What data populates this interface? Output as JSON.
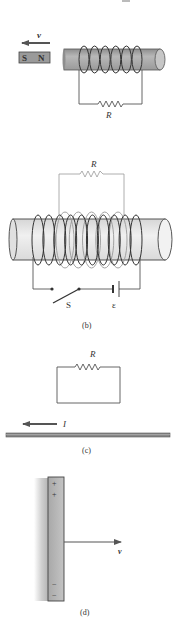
{
  "figure": {
    "panel_a": {
      "top_caption_fragment": "",
      "velocity_label": "v",
      "magnet_left_pole": "S",
      "magnet_right_pole": "N",
      "resistor_label": "R",
      "coil_turns": 6
    },
    "panel_b": {
      "resistor_label": "R",
      "switch_label": "S",
      "emf_label": "ε",
      "caption": "(b)",
      "primary_coil_turns": 10,
      "secondary_coil_turns": 5
    },
    "panel_c": {
      "resistor_label": "R",
      "current_label": "I",
      "caption": "(c)"
    },
    "panel_d": {
      "plus_signs": [
        "+",
        "+"
      ],
      "minus_signs": [
        "−",
        "−"
      ],
      "velocity_label": "v",
      "caption": "(d)"
    },
    "colors": {
      "cylinder_a": "#a9a9a9",
      "cylinder_b": "#e6e6e6",
      "magnet": "#9a9a9a",
      "wire": "#555555",
      "plate": "#b5b5b5",
      "conductor_c": "#888888"
    }
  }
}
